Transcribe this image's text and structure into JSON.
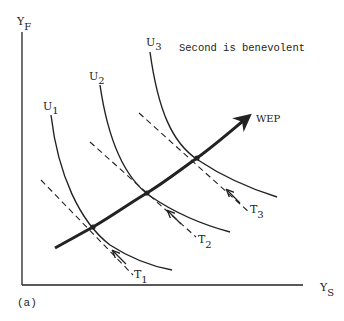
{
  "figure": {
    "panel_label": "(a)",
    "title": "Second is benevolent",
    "axes": {
      "y_label": "Y",
      "y_sub": "F",
      "x_label": "Y",
      "x_sub": "S"
    },
    "curves": [
      {
        "label": "U",
        "sub": "1"
      },
      {
        "label": "U",
        "sub": "2"
      },
      {
        "label": "U",
        "sub": "3"
      }
    ],
    "tangents": [
      {
        "label": "T",
        "sub": "1"
      },
      {
        "label": "T",
        "sub": "2"
      },
      {
        "label": "T",
        "sub": "3"
      }
    ],
    "path_label": "WEP",
    "colors": {
      "ink": "#222222",
      "background": "#ffffff"
    }
  }
}
